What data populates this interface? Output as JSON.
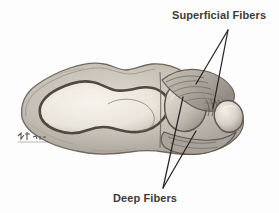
{
  "figure": {
    "background_color": "#fdfdfd",
    "ink_color": "#3b3b3b",
    "width": 279,
    "height": 213
  },
  "labels": {
    "superficial": "Superficial Fibers",
    "deep": "Deep Fibers",
    "annotation": "handwritten-annotation"
  },
  "leaders": {
    "superficial": {
      "apex_x": 228,
      "apex_y": 30,
      "targets": [
        {
          "x": 196,
          "y": 84
        },
        {
          "x": 213,
          "y": 108
        }
      ]
    },
    "deep": {
      "apex_x": 163,
      "apex_y": 188,
      "targets": [
        {
          "x": 183,
          "y": 97
        },
        {
          "x": 196,
          "y": 131
        }
      ]
    }
  },
  "drawing": {
    "type": "grayscale-pencil-anatomical-sketch",
    "subject": "mandible-ramus-sagittal-section",
    "bounds": {
      "x": 18,
      "y": 58,
      "width": 228,
      "height": 98
    },
    "palette": {
      "bone_fill": "#c9c3bb",
      "bone_shade": "#9a938b",
      "bone_outline": "#6f6760",
      "cavity_fill": "#f0ece3",
      "cavity_rim": "#565049",
      "fiber_fill": "#b3aca4",
      "fiber_line": "#5f584f",
      "condyle_fill": "#ded8cf",
      "highlight": "#f5f2ec"
    }
  }
}
